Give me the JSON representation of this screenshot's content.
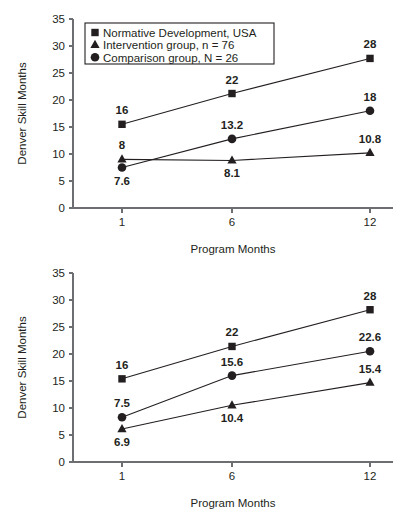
{
  "figure": {
    "background": "#ffffff",
    "ink_color": "#231f20",
    "axis_color": "#6d6e71"
  },
  "chart_data": [
    {
      "panel_id": "top",
      "type": "line",
      "title": "",
      "xlabel": "Program Months",
      "ylabel": "Denver Skill Months",
      "x": [
        1,
        6,
        12
      ],
      "xtick_labels": [
        "1",
        "6",
        "12"
      ],
      "ytick_labels": [
        "0",
        "5",
        "10",
        "15",
        "20",
        "25",
        "30",
        "35"
      ],
      "yticks": [
        0,
        5,
        10,
        15,
        20,
        25,
        30,
        35
      ],
      "ylim": [
        0,
        35
      ],
      "grid": false,
      "legend_position": "upper-left-inside",
      "series": [
        {
          "name": "Normative Development, USA",
          "marker": "square",
          "values": [
            15.5,
            21.2,
            27.7
          ],
          "data_labels": [
            "16",
            "22",
            "28"
          ],
          "label_positions": [
            "above",
            "above",
            "above"
          ]
        },
        {
          "name": "Intervention group, n = 76",
          "marker": "triangle",
          "values": [
            9.0,
            8.8,
            10.2
          ],
          "data_labels": [
            "8",
            "8.1",
            "10.8"
          ],
          "label_positions": [
            "above",
            "below",
            "above"
          ]
        },
        {
          "name": "Comparison group, N = 26",
          "marker": "circle",
          "values": [
            7.5,
            12.8,
            18.0
          ],
          "data_labels": [
            "7.6",
            "13.2",
            "18"
          ],
          "label_positions": [
            "below",
            "above",
            "above"
          ]
        }
      ]
    },
    {
      "panel_id": "bottom",
      "type": "line",
      "title": "",
      "xlabel": "Program Months",
      "ylabel": "Denver Skill Months",
      "x": [
        1,
        6,
        12
      ],
      "xtick_labels": [
        "1",
        "6",
        "12"
      ],
      "ytick_labels": [
        "0",
        "5",
        "10",
        "15",
        "20",
        "25",
        "30",
        "35"
      ],
      "yticks": [
        0,
        5,
        10,
        15,
        20,
        25,
        30,
        35
      ],
      "ylim": [
        0,
        35
      ],
      "grid": false,
      "legend_position": "none",
      "series": [
        {
          "name": "Normative Development, USA",
          "marker": "square",
          "values": [
            15.4,
            21.4,
            28.2
          ],
          "data_labels": [
            "16",
            "22",
            "28"
          ],
          "label_positions": [
            "above",
            "above",
            "above"
          ]
        },
        {
          "name": "Intervention group, n = 76",
          "marker": "triangle",
          "values": [
            6.1,
            10.5,
            14.7
          ],
          "data_labels": [
            "6.9",
            "10.4",
            "15.4"
          ],
          "label_positions": [
            "below",
            "below",
            "above"
          ]
        },
        {
          "name": "Comparison group, N = 26",
          "marker": "circle",
          "values": [
            8.3,
            16.0,
            20.5
          ],
          "data_labels": [
            "7.5",
            "15.6",
            "22.6"
          ],
          "label_positions": [
            "above",
            "above",
            "above"
          ]
        }
      ]
    }
  ],
  "legend": {
    "entries": [
      {
        "marker": "square",
        "label": "Normative Development, USA"
      },
      {
        "marker": "triangle",
        "label": "Intervention group, n = 76"
      },
      {
        "marker": "circle",
        "label": "Comparison group, N = 26"
      }
    ]
  }
}
